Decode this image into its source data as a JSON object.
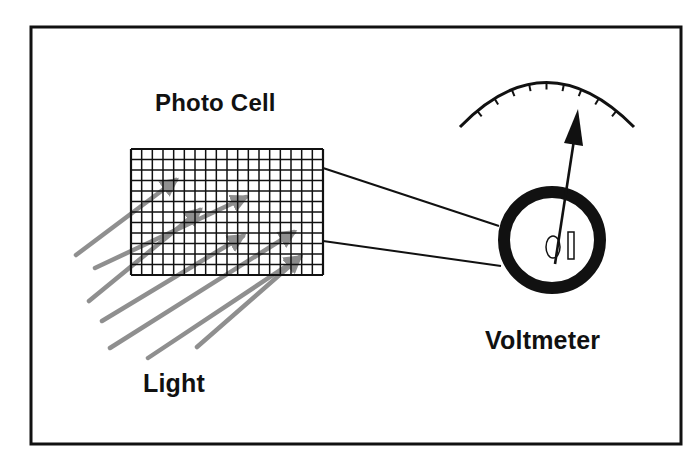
{
  "diagram": {
    "type": "physics-illustration",
    "labels": {
      "photo_cell": "Photo Cell",
      "voltmeter": "Voltmeter",
      "light": "Light"
    },
    "colors": {
      "background": "#ffffff",
      "frame": "#111111",
      "ink": "#111111",
      "light_rays": "#8a8a8a"
    },
    "frame": {
      "x": 31,
      "y": 27,
      "width": 650,
      "height": 417
    },
    "photo_cell_grid": {
      "x": 131,
      "y": 149,
      "width": 192,
      "height": 126,
      "columns": 18,
      "rows": 12
    },
    "wires": [
      {
        "from": [
          323,
          168
        ],
        "to": [
          499,
          226
        ]
      },
      {
        "from": [
          323,
          241
        ],
        "to": [
          501,
          266
        ]
      }
    ],
    "voltmeter": {
      "dial": {
        "cx": 552,
        "cy": 240,
        "outer_radius": 54,
        "ring_width": 12
      },
      "scale_arc": {
        "left": [
          460,
          126
        ],
        "top": [
          546,
          80
        ],
        "right": [
          634,
          126
        ],
        "tick_count": 9
      },
      "needle": {
        "pivot": [
          555,
          263
        ],
        "tip": [
          578,
          110
        ]
      },
      "terminal_symbols": [
        "oval",
        "bar"
      ]
    },
    "light_rays": {
      "count": 7,
      "rays": [
        {
          "from": [
            76,
            255
          ],
          "to": [
            176,
            180
          ]
        },
        {
          "from": [
            95,
            268
          ],
          "to": [
            246,
            197
          ]
        },
        {
          "from": [
            89,
            301
          ],
          "to": [
            200,
            210
          ]
        },
        {
          "from": [
            102,
            321
          ],
          "to": [
            243,
            236
          ]
        },
        {
          "from": [
            110,
            348
          ],
          "to": [
            294,
            232
          ]
        },
        {
          "from": [
            148,
            358
          ],
          "to": [
            300,
            257
          ]
        },
        {
          "from": [
            197,
            347
          ],
          "to": [
            300,
            257
          ]
        }
      ]
    }
  }
}
